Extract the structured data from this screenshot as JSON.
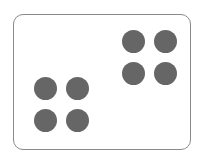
{
  "diagram": {
    "frame": {
      "border_color": "#8a8a8a",
      "background": "#ffffff"
    },
    "dot_color": "#666666",
    "groups": [
      {
        "name": "top-right-group",
        "count": 4,
        "dots": [
          {
            "cx": 133,
            "cy": 41
          },
          {
            "cx": 165,
            "cy": 41
          },
          {
            "cx": 133,
            "cy": 73
          },
          {
            "cx": 165,
            "cy": 73
          }
        ]
      },
      {
        "name": "bottom-left-group",
        "count": 4,
        "dots": [
          {
            "cx": 45,
            "cy": 88
          },
          {
            "cx": 77,
            "cy": 88
          },
          {
            "cx": 45,
            "cy": 120
          },
          {
            "cx": 77,
            "cy": 120
          }
        ]
      }
    ]
  }
}
